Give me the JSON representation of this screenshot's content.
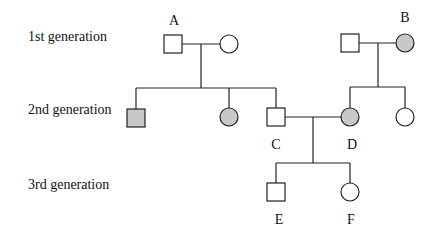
{
  "diagram": {
    "type": "pedigree",
    "generation_labels": [
      "1st generation",
      "2nd generation",
      "3rd generation"
    ],
    "individual_labels": {
      "A": "A",
      "B": "B",
      "C": "C",
      "D": "D",
      "E": "E",
      "F": "F"
    },
    "colors": {
      "affected": "#c8c8c8",
      "unaffected": "#ffffff",
      "line": "#222222"
    },
    "individuals": [
      {
        "id": "A-male",
        "label": "A",
        "sex": "male",
        "generation": 1,
        "affected": false
      },
      {
        "id": "A-female",
        "label": "",
        "sex": "female",
        "generation": 1,
        "affected": false
      },
      {
        "id": "B-male",
        "label": "",
        "sex": "male",
        "generation": 1,
        "affected": false
      },
      {
        "id": "B-female",
        "label": "B",
        "sex": "female",
        "generation": 1,
        "affected": true
      },
      {
        "id": "II-1",
        "label": "",
        "sex": "male",
        "generation": 2,
        "affected": true,
        "parents": "A"
      },
      {
        "id": "II-2",
        "label": "",
        "sex": "female",
        "generation": 2,
        "affected": true,
        "parents": "A"
      },
      {
        "id": "C",
        "label": "C",
        "sex": "male",
        "generation": 2,
        "affected": false,
        "parents": "A"
      },
      {
        "id": "D",
        "label": "D",
        "sex": "female",
        "generation": 2,
        "affected": true,
        "parents": "B"
      },
      {
        "id": "II-5",
        "label": "",
        "sex": "female",
        "generation": 2,
        "affected": false,
        "parents": "B"
      },
      {
        "id": "E",
        "label": "E",
        "sex": "male",
        "generation": 3,
        "affected": false,
        "parents": "C x D"
      },
      {
        "id": "F",
        "label": "F",
        "sex": "female",
        "generation": 3,
        "affected": false,
        "parents": "C x D"
      }
    ]
  }
}
